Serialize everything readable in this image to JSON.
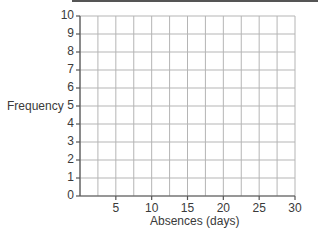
{
  "chart_data": {
    "type": "bar",
    "title": "",
    "xlabel": "Absences (days)",
    "ylabel": "Frequency",
    "x_ticks": [
      "5",
      "10",
      "15",
      "20",
      "25",
      "30"
    ],
    "y_ticks": [
      "0",
      "1",
      "2",
      "3",
      "4",
      "5",
      "6",
      "7",
      "8",
      "9",
      "10"
    ],
    "xlim": [
      0,
      30
    ],
    "ylim": [
      0,
      10
    ],
    "grid": true,
    "grid_x_step": 2.5,
    "grid_y_step": 1,
    "categories": [],
    "values": [],
    "legend": null,
    "colors": {
      "grid": "#b5b5b5",
      "axis": "#555555",
      "text": "#3a3a3a"
    }
  },
  "labels": {
    "ylabel": "Frequency",
    "xlabel": "Absences (days)",
    "y": [
      "0",
      "1",
      "2",
      "3",
      "4",
      "5",
      "6",
      "7",
      "8",
      "9",
      "10"
    ],
    "x": [
      "5",
      "10",
      "15",
      "20",
      "25",
      "30"
    ]
  }
}
